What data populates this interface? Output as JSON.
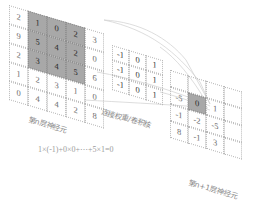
{
  "figure": {
    "type": "diagram",
    "formula": "1×(-1)+0×0+⋯+5×1=0"
  },
  "input_layer": {
    "label": "第n层神经元",
    "rows": 5,
    "cols": 5,
    "values": [
      [
        "2",
        "1",
        "0",
        "2",
        "3"
      ],
      [
        "9",
        "5",
        "4",
        "2",
        "0"
      ],
      [
        "2",
        "3",
        "4",
        "5",
        "6"
      ],
      [
        "1",
        "2",
        "3",
        "1",
        "0"
      ],
      [
        "0",
        "4",
        "4",
        "2",
        "8"
      ]
    ],
    "highlight": {
      "row_start": 0,
      "col_start": 1,
      "rows": 3,
      "cols": 3,
      "values": [
        [
          "1",
          "0",
          "2"
        ],
        [
          "5",
          "4",
          "2"
        ],
        [
          "3",
          "4",
          "5"
        ]
      ]
    }
  },
  "kernel": {
    "label": "连接权重/卷积核",
    "rows": 3,
    "cols": 3,
    "values": [
      [
        "-1",
        "0",
        "1"
      ],
      [
        "-1",
        "0",
        "1"
      ],
      [
        "-1",
        "0",
        "1"
      ]
    ]
  },
  "output_layer": {
    "label": "第n+1层神经元",
    "rows": 4,
    "cols": 4,
    "values": [
      [
        "",
        "",
        "",
        ""
      ],
      [
        "-5",
        "0",
        "1",
        ""
      ],
      [
        "-1",
        "-2",
        "-5",
        ""
      ],
      [
        "8",
        "-1",
        "3",
        ""
      ]
    ],
    "highlight": {
      "row": 1,
      "col": 1,
      "value": "0"
    }
  },
  "colors": {
    "grid_line": "#b9b9b9",
    "highlight_fill": "#a8a8a8",
    "text": "#3a3a3a",
    "label_text": "#8a8a8a",
    "connector": "#cfcfcf",
    "background": "#ffffff"
  }
}
